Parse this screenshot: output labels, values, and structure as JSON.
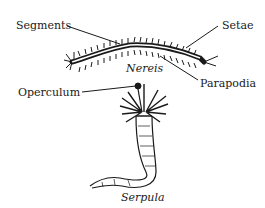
{
  "diagram": {
    "labels": {
      "segments": "Segments",
      "setae": "Setae",
      "nereis": "Nereis",
      "parapodia": "Parapodia",
      "operculum": "Operculum",
      "serpula": "Serpula"
    },
    "colors": {
      "ink": "#1a1a1a",
      "background": "#ffffff"
    }
  }
}
